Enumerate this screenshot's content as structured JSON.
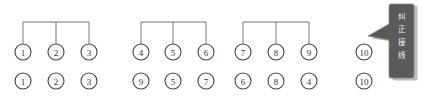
{
  "diagram": {
    "groups": [
      {
        "name": "group-1",
        "bus_y": 22,
        "xs": [
          23,
          56,
          89
        ],
        "top_labels": [
          "1",
          "2",
          "3"
        ],
        "bottom_labels": [
          "1",
          "2",
          "3"
        ]
      },
      {
        "name": "group-2",
        "bus_y": 22,
        "xs": [
          141,
          173,
          206
        ],
        "top_labels": [
          "4",
          "5",
          "6"
        ],
        "bottom_labels": [
          "9",
          "5",
          "7"
        ]
      },
      {
        "name": "group-3",
        "bus_y": 22,
        "xs": [
          243,
          276,
          309
        ],
        "top_labels": [
          "7",
          "8",
          "9"
        ],
        "bottom_labels": [
          "6",
          "8",
          "4"
        ]
      }
    ],
    "standalone": {
      "x": 364,
      "top_label": "10",
      "bottom_label": "10"
    },
    "rows": {
      "top_y": 52,
      "bottom_y": 81,
      "radius": 8
    },
    "callout": {
      "text": "纠正接线",
      "chars": [
        "纠",
        "正",
        "接",
        "线"
      ],
      "fill": "#5a5a5a"
    }
  }
}
